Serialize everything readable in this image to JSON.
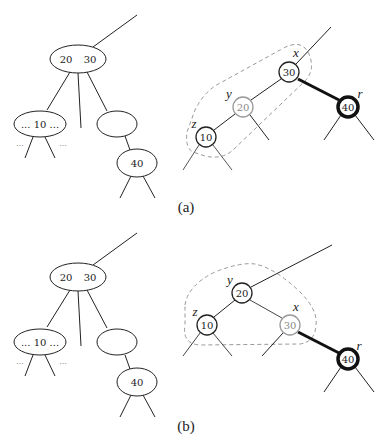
{
  "panels": [
    {
      "caption": "(a)",
      "left_tree": {
        "root": {
          "keys": [
            "20",
            "30"
          ]
        },
        "left_child": {
          "label": "... 10 ...",
          "side_dots_left": "...",
          "side_dots_right": "..."
        },
        "right_child": {
          "label": ""
        },
        "grandchild": {
          "label": "40"
        }
      },
      "right_tree": {
        "nodes": [
          {
            "id": "x",
            "key": "30",
            "label": "x"
          },
          {
            "id": "y",
            "key": "20",
            "label": "y",
            "style": "gray"
          },
          {
            "id": "z",
            "key": "10",
            "label": "z"
          },
          {
            "id": "r",
            "key": "40",
            "label": "r",
            "style": "bold"
          }
        ]
      }
    },
    {
      "caption": "(b)",
      "left_tree": {
        "root": {
          "keys": [
            "20",
            "30"
          ]
        },
        "left_child": {
          "label": "... 10 ...",
          "side_dots_left": "...",
          "side_dots_right": "..."
        },
        "right_child": {
          "label": ""
        },
        "grandchild": {
          "label": "40"
        }
      },
      "right_tree": {
        "nodes": [
          {
            "id": "y",
            "key": "20",
            "label": "y"
          },
          {
            "id": "z",
            "key": "10",
            "label": "z"
          },
          {
            "id": "x",
            "key": "30",
            "label": "x",
            "style": "gray"
          },
          {
            "id": "r",
            "key": "40",
            "label": "r",
            "style": "bold"
          }
        ]
      }
    }
  ],
  "colors": {
    "stroke": "#222222",
    "gray_stroke": "#999999",
    "dashed": "#999999"
  }
}
